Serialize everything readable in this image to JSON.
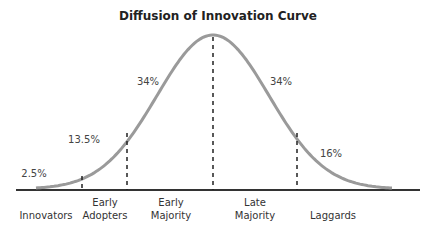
{
  "chart_data": {
    "type": "area",
    "title": "Diffusion of Innovation Curve",
    "xlabel": "",
    "ylabel": "",
    "grid": false,
    "legend": "none",
    "distribution": "normal (bell curve)",
    "categories": [
      "Innovators",
      "Early Adopters",
      "Early Majority",
      "Late Majority",
      "Laggards"
    ],
    "values": [
      2.5,
      13.5,
      34,
      34,
      16
    ],
    "value_labels": [
      "2.5%",
      "13.5%",
      "34%",
      "34%",
      "16%"
    ],
    "category_labels": [
      [
        "Innovators"
      ],
      [
        "Early",
        "Adopters"
      ],
      [
        "Early",
        "Majority"
      ],
      [
        "Late",
        "Majority"
      ],
      [
        "Laggards"
      ]
    ],
    "divider_style": "dashed vertical lines at segment boundaries",
    "colors": {
      "curve": "#9a9a9a",
      "baseline": "#333333",
      "divider": "#222222",
      "text": "#333333"
    }
  }
}
